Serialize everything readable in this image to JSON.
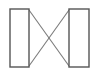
{
  "canvas": {
    "width": 95,
    "height": 76,
    "background_color": "#ffffff",
    "title": "Crossed connection diagram"
  },
  "style": {
    "node_stroke_color": "#555555",
    "node_fill_color": "#ffffff",
    "node_stroke_width": 1.4,
    "link_stroke_color": "#7b7b7b",
    "link_stroke_width": 1.1
  },
  "nodes": [
    {
      "id": "left-block",
      "label": "",
      "shape": "rectangle",
      "x": 10,
      "y": 9,
      "width": 19,
      "height": 58
    },
    {
      "id": "right-block",
      "label": "",
      "shape": "rectangle",
      "x": 69,
      "y": 9,
      "width": 20,
      "height": 58
    }
  ],
  "links": [
    {
      "id": "link-top-left-to-bottom-right",
      "from": "left-block",
      "to": "right-block",
      "x1": 29,
      "y1": 10,
      "x2": 69,
      "y2": 66
    },
    {
      "id": "link-bottom-left-to-top-right",
      "from": "left-block",
      "to": "right-block",
      "x1": 29,
      "y1": 66,
      "x2": 69,
      "y2": 10
    }
  ],
  "crossing_point": {
    "x": 49,
    "y": 38
  }
}
